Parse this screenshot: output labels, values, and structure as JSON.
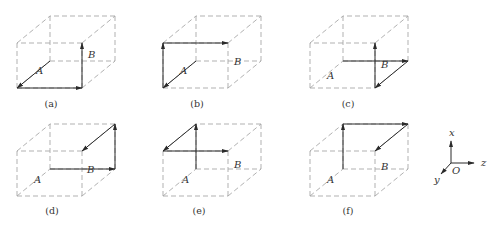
{
  "figure": {
    "colors": {
      "edge": "#a8a8a8",
      "vector": "#2a2a2a",
      "text": "#333333",
      "background": "#ffffff"
    },
    "cube_size": {
      "width": 65,
      "height": 45,
      "depth_dx": 33,
      "depth_dy": -27
    },
    "panels": [
      {
        "id": "a",
        "caption": "(a)",
        "origin": [
          17,
          88
        ],
        "caption_pos": [
          51,
          107
        ],
        "label_A": "A",
        "label_A_pos": [
          36,
          74
        ],
        "label_B": "B",
        "label_B_pos": [
          88,
          58
        ],
        "vectors": [
          {
            "from": "backBL",
            "to": "frontBL"
          },
          {
            "from": "frontBL",
            "to": "frontBR"
          },
          {
            "from": "frontBR",
            "to": "frontTR"
          }
        ]
      },
      {
        "id": "b",
        "caption": "(b)",
        "origin": [
          163,
          88
        ],
        "caption_pos": [
          197,
          107
        ],
        "label_A": "A",
        "label_A_pos": [
          180,
          74
        ],
        "label_B": "B",
        "label_B_pos": [
          234,
          65
        ],
        "vectors": [
          {
            "from": "backBL",
            "to": "frontBL"
          },
          {
            "from": "frontBL",
            "to": "frontTL"
          },
          {
            "from": "frontTL",
            "to": "frontTR"
          }
        ]
      },
      {
        "id": "c",
        "caption": "(c)",
        "origin": [
          310,
          88
        ],
        "caption_pos": [
          348,
          107
        ],
        "label_A": "A",
        "label_A_pos": [
          327,
          79
        ],
        "label_B": "B",
        "label_B_pos": [
          381,
          68
        ],
        "vectors": [
          {
            "from": "backBL",
            "to": "backBR"
          },
          {
            "from": "backBR",
            "to": "frontBR"
          },
          {
            "from": "frontBR",
            "to": "frontTR"
          }
        ]
      },
      {
        "id": "d",
        "caption": "(d)",
        "origin": [
          17,
          196
        ],
        "caption_pos": [
          52,
          214
        ],
        "label_A": "A",
        "label_A_pos": [
          34,
          183
        ],
        "label_B": "B",
        "label_B_pos": [
          87,
          173
        ],
        "vectors": [
          {
            "from": "backBL",
            "to": "backBR"
          },
          {
            "from": "backBR",
            "to": "backTR"
          },
          {
            "from": "backTR",
            "to": "frontTR"
          }
        ]
      },
      {
        "id": "e",
        "caption": "(e)",
        "origin": [
          163,
          196
        ],
        "caption_pos": [
          199,
          214
        ],
        "label_A": "A",
        "label_A_pos": [
          182,
          183
        ],
        "label_B": "B",
        "label_B_pos": [
          234,
          168
        ],
        "vectors": [
          {
            "from": "backBL",
            "to": "backTL"
          },
          {
            "from": "backTL",
            "to": "frontTL"
          },
          {
            "from": "frontTL",
            "to": "frontTR"
          }
        ]
      },
      {
        "id": "f",
        "caption": "(f)",
        "origin": [
          310,
          196
        ],
        "caption_pos": [
          348,
          214
        ],
        "label_A": "A",
        "label_A_pos": [
          327,
          183
        ],
        "label_B": "B",
        "label_B_pos": [
          381,
          170
        ],
        "vectors": [
          {
            "from": "backBL",
            "to": "backTL"
          },
          {
            "from": "backTL",
            "to": "backTR"
          },
          {
            "from": "backTR",
            "to": "frontTR"
          }
        ]
      }
    ],
    "axes": {
      "origin": [
        451,
        163
      ],
      "x_label": "x",
      "x_tip": [
        451,
        141
      ],
      "x_label_pos": [
        449,
        136
      ],
      "z_label": "z",
      "z_tip": [
        474,
        163
      ],
      "z_label_pos": [
        481,
        166
      ],
      "y_label": "y",
      "y_tip": [
        441,
        174
      ],
      "y_label_pos": [
        434,
        183
      ],
      "O_label": "O",
      "O_label_pos": [
        452,
        174
      ]
    }
  }
}
